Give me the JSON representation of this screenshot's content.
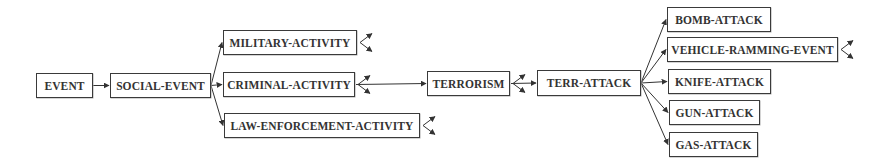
{
  "diagram": {
    "type": "taxonomy-tree",
    "nodes": [
      {
        "id": "event",
        "label": "EVENT",
        "x": 36,
        "y": 73,
        "w": 57,
        "h": 25,
        "expandable": false
      },
      {
        "id": "social-event",
        "label": "SOCIAL-EVENT",
        "x": 110,
        "y": 73,
        "w": 101,
        "h": 25,
        "expandable": false
      },
      {
        "id": "military-activity",
        "label": "MILITARY-ACTIVITY",
        "x": 223,
        "y": 30,
        "w": 134,
        "h": 25,
        "expandable": true
      },
      {
        "id": "criminal-activity",
        "label": "CRIMINAL-ACTIVITY",
        "x": 223,
        "y": 72,
        "w": 132,
        "h": 25,
        "expandable": true
      },
      {
        "id": "law-enforcement-activity",
        "label": "LAW-ENFORCEMENT-ACTIVITY",
        "x": 224,
        "y": 113,
        "w": 196,
        "h": 25,
        "expandable": true
      },
      {
        "id": "terrorism",
        "label": "TERRORISM",
        "x": 427,
        "y": 71,
        "w": 83,
        "h": 25,
        "expandable": true
      },
      {
        "id": "terr-attack",
        "label": "TERR-ATTACK",
        "x": 537,
        "y": 70,
        "w": 104,
        "h": 26,
        "expandable": false
      },
      {
        "id": "bomb-attack",
        "label": "BOMB-ATTACK",
        "x": 667,
        "y": 7,
        "w": 104,
        "h": 25,
        "expandable": false
      },
      {
        "id": "vehicle-ramming-event",
        "label": "VEHICLE-RAMMING-EVENT",
        "x": 667,
        "y": 37,
        "w": 171,
        "h": 25,
        "expandable": true
      },
      {
        "id": "knife-attack",
        "label": "KNIFE-ATTACK",
        "x": 668,
        "y": 69,
        "w": 103,
        "h": 25,
        "expandable": false
      },
      {
        "id": "gun-attack",
        "label": "GUN-ATTACK",
        "x": 669,
        "y": 100,
        "w": 91,
        "h": 25,
        "expandable": false
      },
      {
        "id": "gas-attack",
        "label": "GAS-ATTACK",
        "x": 669,
        "y": 132,
        "w": 89,
        "h": 25,
        "expandable": false
      }
    ],
    "edges": [
      {
        "from": "event",
        "to": "social-event"
      },
      {
        "from": "social-event",
        "to": "military-activity"
      },
      {
        "from": "social-event",
        "to": "criminal-activity"
      },
      {
        "from": "social-event",
        "to": "law-enforcement-activity"
      },
      {
        "from": "criminal-activity",
        "to": "terrorism"
      },
      {
        "from": "terrorism",
        "to": "terr-attack"
      },
      {
        "from": "terr-attack",
        "to": "bomb-attack"
      },
      {
        "from": "terr-attack",
        "to": "vehicle-ramming-event"
      },
      {
        "from": "terr-attack",
        "to": "knife-attack"
      },
      {
        "from": "terr-attack",
        "to": "gun-attack"
      },
      {
        "from": "terr-attack",
        "to": "gas-attack"
      }
    ],
    "colors": {
      "stroke": "#333333",
      "text": "#333333",
      "background": "#ffffff"
    }
  }
}
